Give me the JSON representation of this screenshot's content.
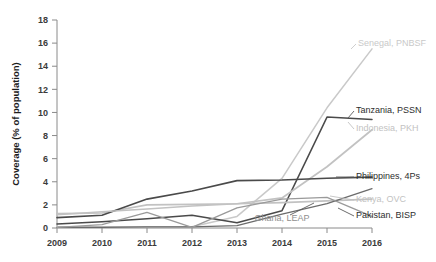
{
  "chart_data": {
    "type": "line",
    "title": "",
    "subtitle": "",
    "xlabel": "",
    "ylabel": "Coverage (% of population)",
    "x": [
      2009,
      2010,
      2011,
      2012,
      2013,
      2014,
      2015,
      2016
    ],
    "categories": [
      "2009",
      "2010",
      "2011",
      "2012",
      "2013",
      "2014",
      "2015",
      "2016"
    ],
    "xlim": [
      2009,
      2016
    ],
    "ylim": [
      0,
      18
    ],
    "yticks": [
      0,
      2,
      4,
      6,
      8,
      10,
      12,
      14,
      16,
      18
    ],
    "ytick_labels": [
      "0",
      "2",
      "4",
      "6",
      "8",
      "10",
      "12",
      "14",
      "16",
      "18"
    ],
    "grid": false,
    "legend_position": "inline-right",
    "series": [
      {
        "name": "Senegal, PNBSF",
        "color": "#c9c9c9",
        "values": [
          0.1,
          0.1,
          0.1,
          0.1,
          1.0,
          4.3,
          10.4,
          15.5
        ]
      },
      {
        "name": "Tanzania, PSSN",
        "color": "#4a4a4a",
        "values": [
          0.35,
          0.55,
          0.8,
          1.1,
          0.45,
          1.5,
          9.6,
          9.4
        ]
      },
      {
        "name": "Indonesia, PKH",
        "color": "#c2c2c2",
        "values": [
          1.25,
          1.3,
          2.0,
          2.05,
          2.1,
          2.6,
          5.3,
          8.5
        ]
      },
      {
        "name": "Philippines, 4Ps",
        "color": "#4a4a4a",
        "values": [
          0.9,
          1.1,
          2.5,
          3.2,
          4.1,
          4.15,
          4.3,
          4.4
        ]
      },
      {
        "name": "Kenya, OVC",
        "color": "#c2c2c2",
        "values": [
          1.15,
          1.4,
          1.65,
          1.9,
          2.1,
          2.2,
          2.35,
          2.5
        ]
      },
      {
        "name": "Pakistan, BISP",
        "color": "#6b6b6b",
        "values": [
          0.05,
          0.05,
          0.1,
          0.1,
          0.2,
          1.2,
          2.1,
          3.4
        ]
      },
      {
        "name": "Ghana, LEAP",
        "color": "#9a9a9a",
        "values": [
          0.05,
          0.3,
          1.35,
          0.05,
          1.75,
          2.5,
          2.65,
          1.0
        ]
      }
    ],
    "annotations": [
      {
        "text": "Senegal, PNBSF",
        "color": "#c9c9c9"
      },
      {
        "text": "Tanzania, PSSN",
        "color": "#2e2e2e"
      },
      {
        "text": "Indonesia, PKH",
        "color": "#c2c2c2"
      },
      {
        "text": "Philippines, 4Ps",
        "color": "#2e2e2e"
      },
      {
        "text": "Kenya, OVC",
        "color": "#c2c2c2"
      },
      {
        "text": "Pakistan, BISP",
        "color": "#2e2e2e"
      },
      {
        "text": "Ghana, LEAP",
        "color": "#8f8f8f"
      }
    ]
  },
  "axes": {
    "y_title": "Coverage (% of population)",
    "y_labels": [
      "18",
      "16",
      "14",
      "12",
      "10",
      "8",
      "6",
      "4",
      "2",
      "0"
    ],
    "x_labels": [
      "2009",
      "2010",
      "2011",
      "2012",
      "2013",
      "2014",
      "2015",
      "2016"
    ]
  },
  "labels": {
    "senegal": "Senegal, PNBSF",
    "tanzania": "Tanzania, PSSN",
    "indonesia": "Indonesia, PKH",
    "philippines": "Philippines, 4Ps",
    "kenya": "Kenya, OVC",
    "pakistan": "Pakistan, BISP",
    "ghana": "Ghana, LEAP"
  },
  "colors": {
    "senegal": "#c9c9c9",
    "tanzania": "#4a4a4a",
    "indonesia": "#c2c2c2",
    "philippines": "#4a4a4a",
    "kenya": "#c2c2c2",
    "pakistan": "#6b6b6b",
    "ghana": "#9a9a9a",
    "axis": "#8a8a8a",
    "text_dark": "#2e2e2e",
    "text_light": "#c2c2c2",
    "background": "#ffffff"
  }
}
